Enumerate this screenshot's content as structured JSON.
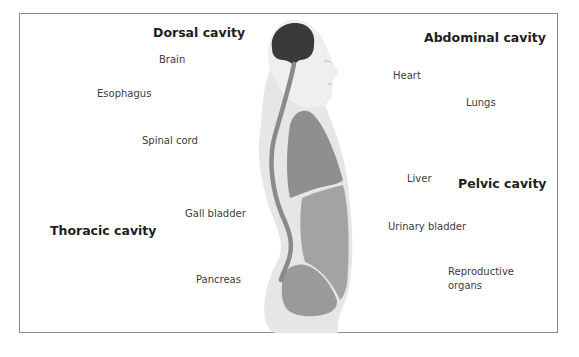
{
  "diagram": {
    "type": "anatomical-labels",
    "headings": {
      "dorsal": "Dorsal cavity",
      "thoracic": "Thoracic cavity",
      "abdominal": "Abdominal cavity",
      "pelvic": "Pelvic cavity"
    },
    "labels": {
      "brain": "Brain",
      "esophagus": "Esophagus",
      "spinal_cord": "Spinal cord",
      "gall_bladder": "Gall bladder",
      "pancreas": "Pancreas",
      "heart": "Heart",
      "lungs": "Lungs",
      "liver": "Liver",
      "urinary_bladder": "Urinary bladder",
      "reproductive_line1": "Reproductive",
      "reproductive_line2": "organs"
    },
    "colors": {
      "frame": "#8c8c8c",
      "body": "#e6e6e6",
      "head": "#efefef",
      "brain": "#3a3a3a",
      "spine": "#8a8a8a",
      "thoracic_region": "#8f8f8f",
      "abdominal_region": "#a3a3a3",
      "pelvic_region": "#9a9a9a",
      "heading_text": "#1e1e1e",
      "label_text": "#3c3c3c"
    }
  }
}
